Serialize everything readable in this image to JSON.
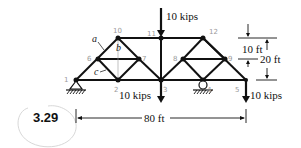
{
  "figure": {
    "number": "3.29",
    "loads": [
      {
        "label": "10 kips",
        "node": "11",
        "direction": "down"
      },
      {
        "label": "10 kips",
        "node": "3",
        "direction": "down"
      },
      {
        "label": "10 kips",
        "node": "5",
        "direction": "down"
      }
    ],
    "dimensions": {
      "span": "80 ft",
      "upper_height": "10 ft",
      "total_height": "20 ft"
    },
    "member_labels": {
      "a": "a",
      "b": "b",
      "c": "c"
    },
    "node_labels": {
      "n1": "1",
      "n2": "2",
      "n3": "3",
      "n4": "4",
      "n5": "5",
      "n6": "6",
      "n7": "7",
      "n8": "8",
      "n9": "9",
      "n10": "10",
      "n11": "11",
      "n12": "12"
    }
  }
}
